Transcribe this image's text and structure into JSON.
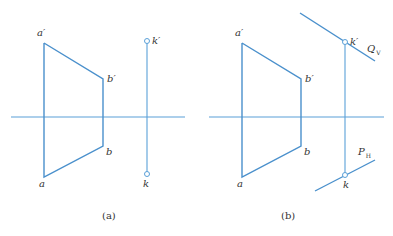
{
  "colors": {
    "line": "#5aa0d8",
    "text": "#333333",
    "background": "#ffffff"
  },
  "panels": [
    {
      "caption": "(a)",
      "labels": {
        "a_prime": "a′",
        "b_prime": "b′",
        "b": "b",
        "a": "a",
        "k_prime": "k′",
        "k": "k"
      }
    },
    {
      "caption": "(b)",
      "labels": {
        "a_prime": "a′",
        "b_prime": "b′",
        "b": "b",
        "a": "a",
        "k_prime": "k′",
        "k": "k",
        "q_main": "Q",
        "q_sub": "V",
        "p_main": "P",
        "p_sub": "H"
      }
    }
  ]
}
